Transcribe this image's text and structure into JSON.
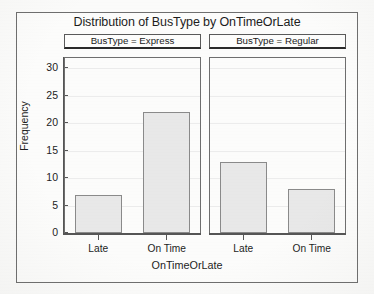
{
  "chart_data": {
    "type": "bar",
    "title": "Distribution of BusType by OnTimeOrLate",
    "xlabel": "OnTimeOrLate",
    "ylabel": "Frequency",
    "categories": [
      "Late",
      "On Time"
    ],
    "ylim": [
      0,
      31.5
    ],
    "yticks": [
      0,
      5,
      10,
      15,
      20,
      25,
      30
    ],
    "ytick_labels": [
      "0",
      "5",
      "10",
      "15",
      "20",
      "25",
      "30"
    ],
    "grid": true,
    "legend": "none",
    "panel_variable": "BusType",
    "panels": [
      {
        "header": "BusType = Express",
        "level": "Express",
        "categories": [
          "Late",
          "On Time"
        ],
        "values": [
          7,
          22
        ]
      },
      {
        "header": "BusType = Regular",
        "level": "Regular",
        "categories": [
          "Late",
          "On Time"
        ],
        "values": [
          13,
          8
        ]
      }
    ],
    "colors": {
      "bar_fill": "#e8e8e8",
      "bar_border": "#8a8a8a",
      "axis": "#555555",
      "grid": "#ececec",
      "text": "#1d1d1d",
      "frame": "#6e6e6e",
      "background": "#fbfbfa"
    }
  }
}
